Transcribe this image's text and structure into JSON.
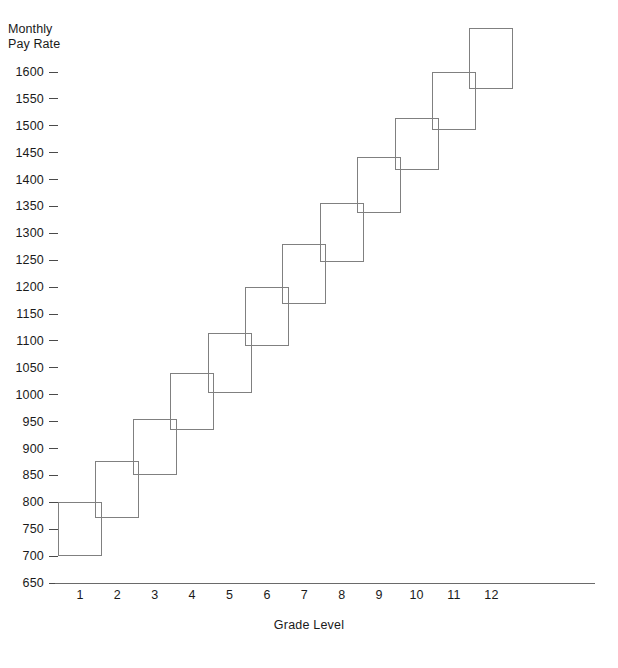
{
  "chart_data": {
    "type": "bar",
    "title": "",
    "subtitle": "",
    "ylabel": "Monthly\nPay Rate",
    "xlabel": "Grade Level",
    "categories": [
      "1",
      "2",
      "3",
      "4",
      "5",
      "6",
      "7",
      "8",
      "9",
      "10",
      "11",
      "12"
    ],
    "ytick_labels": [
      "1600",
      "1550",
      "1500",
      "1450",
      "1400",
      "1350",
      "1300",
      "1250",
      "1200",
      "1150",
      "1100",
      "1050",
      "1000",
      "950",
      "900",
      "850",
      "800",
      "750",
      "700",
      "650"
    ],
    "ytick_values": [
      1600,
      1550,
      1500,
      1450,
      1400,
      1350,
      1300,
      1250,
      1200,
      1150,
      1100,
      1050,
      1000,
      950,
      900,
      850,
      800,
      750,
      700,
      650
    ],
    "ylim": [
      650,
      1690
    ],
    "ytick_step": 50,
    "grid": false,
    "legend": null,
    "series": [
      {
        "name": "Pay range (minimum)",
        "values": [
          700,
          770,
          850,
          935,
          1003,
          1090,
          1168,
          1247,
          1337,
          1417,
          1492,
          1568
        ]
      },
      {
        "name": "Pay range (maximum)",
        "values": [
          800,
          877,
          955,
          1040,
          1115,
          1200,
          1281,
          1357,
          1442,
          1515,
          1600,
          1682
        ]
      }
    ],
    "boxes": [
      {
        "grade": "1",
        "min": 700,
        "max": 800
      },
      {
        "grade": "2",
        "min": 770,
        "max": 877
      },
      {
        "grade": "3",
        "min": 850,
        "max": 955
      },
      {
        "grade": "4",
        "min": 935,
        "max": 1040
      },
      {
        "grade": "5",
        "min": 1003,
        "max": 1115
      },
      {
        "grade": "6",
        "min": 1090,
        "max": 1200
      },
      {
        "grade": "7",
        "min": 1168,
        "max": 1281
      },
      {
        "grade": "8",
        "min": 1247,
        "max": 1357
      },
      {
        "grade": "9",
        "min": 1337,
        "max": 1442
      },
      {
        "grade": "10",
        "min": 1417,
        "max": 1515
      },
      {
        "grade": "11",
        "min": 1492,
        "max": 1600
      },
      {
        "grade": "12",
        "min": 1568,
        "max": 1682
      }
    ],
    "colors": {
      "box_stroke": "#808080",
      "axis": "#6a6a6a",
      "tick_mark": "#4a4a4a",
      "text": "#1a1a1a",
      "background": "#ffffff"
    }
  },
  "layout": {
    "plot_left": 58,
    "plot_right": 595,
    "axis_y": 583,
    "tick_top_y": 72,
    "tick_bottom_y": 583,
    "category_x_start": 80,
    "category_x_step": 37.4,
    "box_width": 44
  }
}
